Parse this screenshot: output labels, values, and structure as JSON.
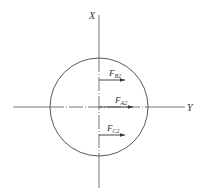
{
  "diagram": {
    "axes": {
      "x_label": "X",
      "y_label": "Y"
    },
    "circle": {
      "cx": 99,
      "cy": 107,
      "r": 49
    },
    "forces": [
      {
        "name": "F_B2",
        "symbol": "F",
        "subscript": "B2",
        "y": 80,
        "x_start": 99,
        "x_end": 125
      },
      {
        "name": "F_A2",
        "symbol": "F",
        "subscript": "A2",
        "y": 107,
        "x_start": 99,
        "x_end": 133
      },
      {
        "name": "F_C2",
        "symbol": "F",
        "subscript": "C2",
        "y": 135,
        "x_start": 99,
        "x_end": 125
      }
    ],
    "colors": {
      "line": "#444444",
      "background": "#ffffff"
    }
  }
}
